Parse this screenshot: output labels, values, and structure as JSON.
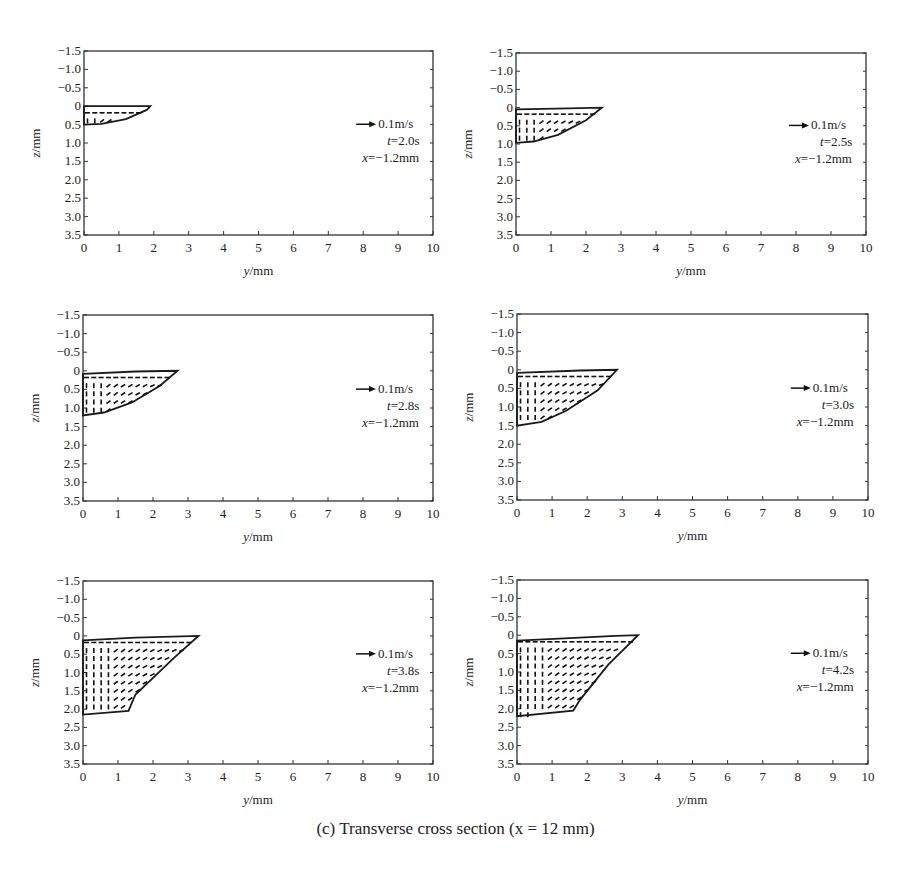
{
  "figure": {
    "caption": "(c) Transverse cross section (x = 12 mm)",
    "legend_arrow_label": "0.1m/s",
    "legend_x_label": "x=−1.2mm"
  },
  "chart_data": [
    {
      "type": "scatter",
      "subtype": "vector-field",
      "title": "",
      "xlabel": "y/mm",
      "ylabel": "z/mm",
      "xlim": [
        0,
        10
      ],
      "ylim": [
        -1.5,
        3.5
      ],
      "y_inverted": true,
      "xticks": [
        "0",
        "1",
        "2",
        "3",
        "4",
        "5",
        "6",
        "7",
        "8",
        "9",
        "10"
      ],
      "yticks": [
        "-1.5",
        "-1.0",
        "-0.5",
        "0",
        "0.5",
        "1.0",
        "1.5",
        "2.0",
        "2.5",
        "3.0",
        "3.5"
      ],
      "grid": false,
      "annotation": [
        "0.1m/s",
        "t=2.0s",
        "x=−1.2mm"
      ],
      "reference_vector": "0.1m/s",
      "t": "2.0s",
      "x": "−1.2mm",
      "pool_boundary": [
        [
          0,
          0.0
        ],
        [
          1.9,
          0.0
        ],
        [
          1.8,
          0.1
        ],
        [
          1.2,
          0.35
        ],
        [
          0.5,
          0.48
        ],
        [
          0,
          0.5
        ]
      ]
    },
    {
      "type": "scatter",
      "subtype": "vector-field",
      "xlabel": "y/mm",
      "ylabel": "z/mm",
      "xlim": [
        0,
        10
      ],
      "ylim": [
        -1.5,
        3.5
      ],
      "y_inverted": true,
      "xticks": [
        "0",
        "1",
        "2",
        "3",
        "4",
        "5",
        "6",
        "7",
        "8",
        "9",
        "10"
      ],
      "yticks": [
        "-1.5",
        "-1.0",
        "-0.5",
        "0",
        "0.5",
        "1.0",
        "1.5",
        "2.0",
        "2.5",
        "3.0",
        "3.5"
      ],
      "grid": false,
      "annotation": [
        "0.1m/s",
        "t=2.5s",
        "x=−1.2mm"
      ],
      "reference_vector": "0.1m/s",
      "t": "2.5s",
      "x": "−1.2mm",
      "pool_boundary": [
        [
          0,
          0.05
        ],
        [
          1.5,
          0.02
        ],
        [
          2.45,
          0.0
        ],
        [
          2.0,
          0.35
        ],
        [
          1.2,
          0.75
        ],
        [
          0.5,
          0.93
        ],
        [
          0,
          0.97
        ]
      ]
    },
    {
      "type": "scatter",
      "subtype": "vector-field",
      "xlabel": "y/mm",
      "ylabel": "z/mm",
      "xlim": [
        0,
        10
      ],
      "ylim": [
        -1.5,
        3.5
      ],
      "y_inverted": true,
      "xticks": [
        "0",
        "1",
        "2",
        "3",
        "4",
        "5",
        "6",
        "7",
        "8",
        "9",
        "10"
      ],
      "yticks": [
        "-1.5",
        "-1.0",
        "-0.5",
        "0",
        "0.5",
        "1.0",
        "1.5",
        "2.0",
        "2.5",
        "3.0",
        "3.5"
      ],
      "grid": false,
      "annotation": [
        "0.1m/s",
        "t=2.8s",
        "x=−1.2mm"
      ],
      "reference_vector": "0.1m/s",
      "t": "2.8s",
      "x": "−1.2mm",
      "pool_boundary": [
        [
          0,
          0.08
        ],
        [
          1.5,
          0.02
        ],
        [
          2.7,
          0.0
        ],
        [
          2.2,
          0.4
        ],
        [
          1.4,
          0.85
        ],
        [
          0.6,
          1.12
        ],
        [
          0,
          1.2
        ]
      ]
    },
    {
      "type": "scatter",
      "subtype": "vector-field",
      "xlabel": "y/mm",
      "ylabel": "z/mm",
      "xlim": [
        0,
        10
      ],
      "ylim": [
        -1.5,
        3.5
      ],
      "y_inverted": true,
      "xticks": [
        "0",
        "1",
        "2",
        "3",
        "4",
        "5",
        "6",
        "7",
        "8",
        "9",
        "10"
      ],
      "yticks": [
        "-1.5",
        "-1.0",
        "-0.5",
        "0",
        "0.5",
        "1.0",
        "1.5",
        "2.0",
        "2.5",
        "3.0",
        "3.5"
      ],
      "grid": false,
      "annotation": [
        "0.1m/s",
        "t=3.0s",
        "x=−1.2mm"
      ],
      "reference_vector": "0.1m/s",
      "t": "3.0s",
      "x": "−1.2mm",
      "pool_boundary": [
        [
          0,
          0.08
        ],
        [
          1.8,
          0.02
        ],
        [
          2.85,
          0.0
        ],
        [
          2.3,
          0.55
        ],
        [
          1.4,
          1.1
        ],
        [
          0.7,
          1.4
        ],
        [
          0,
          1.5
        ]
      ]
    },
    {
      "type": "scatter",
      "subtype": "vector-field",
      "xlabel": "y/mm",
      "ylabel": "z/mm",
      "xlim": [
        0,
        10
      ],
      "ylim": [
        -1.5,
        3.5
      ],
      "y_inverted": true,
      "xticks": [
        "0",
        "1",
        "2",
        "3",
        "4",
        "5",
        "6",
        "7",
        "8",
        "9",
        "10"
      ],
      "yticks": [
        "-1.5",
        "-1.0",
        "-0.5",
        "0",
        "0.5",
        "1.0",
        "1.5",
        "2.0",
        "2.5",
        "3.0",
        "3.5"
      ],
      "grid": false,
      "annotation": [
        "0.1m/s",
        "t=3.8s",
        "x=−1.2mm"
      ],
      "reference_vector": "0.1m/s",
      "t": "3.8s",
      "x": "−1.2mm",
      "pool_boundary": [
        [
          0,
          0.12
        ],
        [
          1.5,
          0.05
        ],
        [
          3.3,
          0.0
        ],
        [
          2.6,
          0.6
        ],
        [
          1.5,
          1.6
        ],
        [
          1.3,
          2.05
        ],
        [
          0,
          2.15
        ]
      ]
    },
    {
      "type": "scatter",
      "subtype": "vector-field",
      "xlabel": "y/mm",
      "ylabel": "z/mm",
      "xlim": [
        0,
        10
      ],
      "ylim": [
        -1.5,
        3.5
      ],
      "y_inverted": true,
      "xticks": [
        "0",
        "1",
        "2",
        "3",
        "4",
        "5",
        "6",
        "7",
        "8",
        "9",
        "10"
      ],
      "yticks": [
        "-1.5",
        "-1.0",
        "-0.5",
        "0",
        "0.5",
        "1.0",
        "1.5",
        "2.0",
        "2.5",
        "3.0",
        "3.5"
      ],
      "grid": false,
      "annotation": [
        "0.1m/s",
        "t=4.2s",
        "x=−1.2mm"
      ],
      "reference_vector": "0.1m/s",
      "t": "4.2s",
      "x": "−1.2mm",
      "pool_boundary": [
        [
          0,
          0.15
        ],
        [
          1.5,
          0.08
        ],
        [
          2.8,
          0.02
        ],
        [
          3.45,
          0.0
        ],
        [
          2.6,
          0.8
        ],
        [
          1.8,
          1.75
        ],
        [
          1.6,
          2.05
        ],
        [
          0,
          2.2
        ]
      ]
    }
  ]
}
